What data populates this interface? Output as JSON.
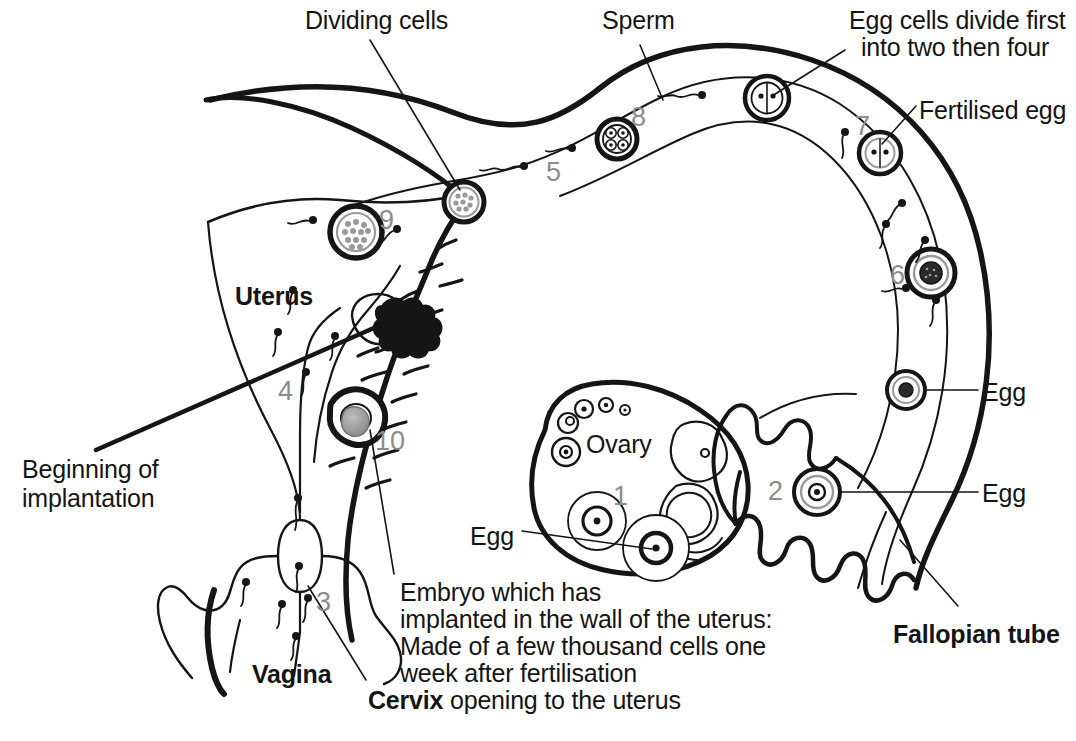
{
  "diagram": {
    "colors": {
      "ink": "#151515",
      "number_gray": "#8c8c8c",
      "fill": "#ffffff",
      "shade": "#9a9a9a"
    }
  },
  "labels": [
    {
      "id": "dividing-cells",
      "text": "Dividing cells",
      "x": 305,
      "y": 6,
      "bold": false
    },
    {
      "id": "sperm",
      "text": "Sperm",
      "x": 602,
      "y": 6,
      "bold": false
    },
    {
      "id": "egg-cells-divide-l1",
      "text": "Egg cells divide first",
      "x": 849,
      "y": 6,
      "bold": false
    },
    {
      "id": "egg-cells-divide-l2",
      "text": "into two then four",
      "x": 861,
      "y": 33,
      "bold": false
    },
    {
      "id": "fertilised-egg",
      "text": "Fertilised egg",
      "x": 919,
      "y": 96,
      "bold": false
    },
    {
      "id": "uterus",
      "text": "Uterus",
      "x": 235,
      "y": 282,
      "bold": true
    },
    {
      "id": "egg-right-upper",
      "text": "Egg",
      "x": 982,
      "y": 378,
      "bold": false
    },
    {
      "id": "egg-right-lower",
      "text": "Egg",
      "x": 982,
      "y": 479,
      "bold": false
    },
    {
      "id": "ovary",
      "text": "Ovary",
      "x": 586,
      "y": 430,
      "bold": false
    },
    {
      "id": "beginning-implantation-l1",
      "text": "Beginning of",
      "x": 22,
      "y": 455,
      "bold": false
    },
    {
      "id": "beginning-implantation-l2",
      "text": "implantation",
      "x": 22,
      "y": 484,
      "bold": false
    },
    {
      "id": "egg-ovary",
      "text": "Egg",
      "x": 470,
      "y": 522,
      "bold": false
    },
    {
      "id": "fallopian-tube",
      "text": "Fallopian tube",
      "x": 893,
      "y": 620,
      "bold": true
    },
    {
      "id": "vagina",
      "text": "Vagina",
      "x": 252,
      "y": 660,
      "bold": true
    }
  ],
  "captions": {
    "embryo": {
      "id": "embryo-caption",
      "x": 400,
      "y": 578,
      "lines": [
        "Embryo which has",
        "implanted in the wall of the uterus:",
        "Made of a few thousand cells one",
        "week after fertilisation"
      ]
    },
    "cervix": {
      "id": "cervix-caption",
      "x": 368,
      "y": 686,
      "bold_part": "Cervix",
      "rest": " opening to the uterus"
    }
  },
  "stage_numbers": [
    {
      "id": "stage-1",
      "text": "1",
      "x": 613,
      "y": 483,
      "note": "ovary follicle"
    },
    {
      "id": "stage-2",
      "text": "2",
      "x": 768,
      "y": 478,
      "note": "egg in funnel"
    },
    {
      "id": "stage-3",
      "text": "3",
      "x": 316,
      "y": 589,
      "note": "cervix"
    },
    {
      "id": "stage-4",
      "text": "4",
      "x": 278,
      "y": 378,
      "note": "uterus cavity"
    },
    {
      "id": "stage-5",
      "text": "5",
      "x": 546,
      "y": 159,
      "note": "tube sperm"
    },
    {
      "id": "stage-6",
      "text": "6",
      "x": 890,
      "y": 262,
      "note": "fertilised egg"
    },
    {
      "id": "stage-7",
      "text": "7",
      "x": 855,
      "y": 113,
      "note": "two-cell"
    },
    {
      "id": "stage-8",
      "text": "8",
      "x": 631,
      "y": 104,
      "note": "four-cell"
    },
    {
      "id": "stage-9",
      "text": "9",
      "x": 379,
      "y": 207,
      "note": "morula in uterus"
    },
    {
      "id": "stage-10",
      "text": "10",
      "x": 375,
      "y": 428,
      "note": "blastocyst"
    }
  ],
  "cells": [
    {
      "id": "cell-morula-dividing",
      "type": "morula",
      "cx": 464,
      "cy": 202,
      "r": 20
    },
    {
      "id": "cell-morula-uterus",
      "type": "morula",
      "cx": 356,
      "cy": 232,
      "r": 26
    },
    {
      "id": "cell-four-cell",
      "type": "four-cell",
      "cx": 617,
      "cy": 139,
      "r": 20
    },
    {
      "id": "cell-two-cell-top",
      "type": "two-cell",
      "cx": 767,
      "cy": 98,
      "r": 22
    },
    {
      "id": "cell-two-cell-right",
      "type": "two-cell",
      "cx": 880,
      "cy": 153,
      "r": 21
    },
    {
      "id": "cell-fertilised-egg",
      "type": "fertilised-egg",
      "cx": 931,
      "cy": 273,
      "r": 24
    },
    {
      "id": "cell-egg-tube-upper",
      "type": "egg",
      "cx": 906,
      "cy": 390,
      "r": 19
    },
    {
      "id": "cell-egg-funnel",
      "type": "egg",
      "cx": 817,
      "cy": 492,
      "r": 23
    },
    {
      "id": "cell-blastocyst",
      "type": "blastocyst",
      "cx": 355,
      "cy": 418,
      "r": 23
    },
    {
      "id": "cell-ovary-egg-a",
      "type": "ovary-follicle",
      "cx": 597,
      "cy": 521,
      "r": 14
    },
    {
      "id": "cell-ovary-egg-b",
      "type": "ovary-follicle",
      "cx": 656,
      "cy": 548,
      "r": 15
    }
  ]
}
